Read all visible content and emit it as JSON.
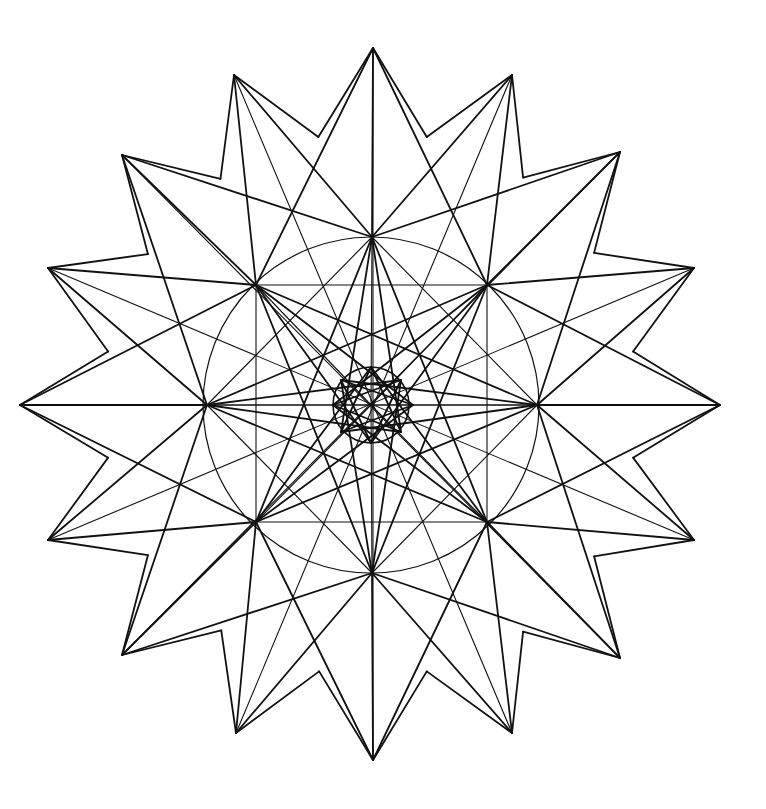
{
  "drawing": {
    "title": "Geometric star mandala line drawing",
    "stroke_color": "#111111",
    "background": "#ffffff",
    "center": [
      371,
      405
    ],
    "outer_tips": [
      [
        373,
        48
      ],
      [
        512,
        75
      ],
      [
        620,
        152
      ],
      [
        694,
        268
      ],
      [
        720,
        405
      ],
      [
        694,
        540
      ],
      [
        620,
        658
      ],
      [
        512,
        733
      ],
      [
        373,
        760
      ],
      [
        236,
        733
      ],
      [
        122,
        655
      ],
      [
        48,
        540
      ],
      [
        20,
        405
      ],
      [
        48,
        268
      ],
      [
        122,
        155
      ],
      [
        234,
        75
      ]
    ],
    "hubs": [
      [
        372,
        237
      ],
      [
        487,
        285
      ],
      [
        537,
        405
      ],
      [
        487,
        522
      ],
      [
        372,
        573
      ],
      [
        256,
        522
      ],
      [
        207,
        405
      ],
      [
        256,
        285
      ]
    ],
    "inner_nodes": [
      [
        371,
        367
      ],
      [
        401,
        380
      ],
      [
        413,
        405
      ],
      [
        401,
        432
      ],
      [
        371,
        443
      ],
      [
        341,
        432
      ],
      [
        333,
        405
      ],
      [
        341,
        380
      ]
    ],
    "valleys": [
      [
        316,
        112
      ],
      [
        430,
        112
      ],
      [
        536,
        185
      ],
      [
        594,
        290
      ],
      [
        628,
        405
      ],
      [
        594,
        520
      ],
      [
        536,
        625
      ],
      [
        430,
        700
      ],
      [
        316,
        700
      ],
      [
        205,
        625
      ],
      [
        148,
        520
      ],
      [
        114,
        405
      ],
      [
        148,
        290
      ],
      [
        205,
        185
      ]
    ]
  }
}
